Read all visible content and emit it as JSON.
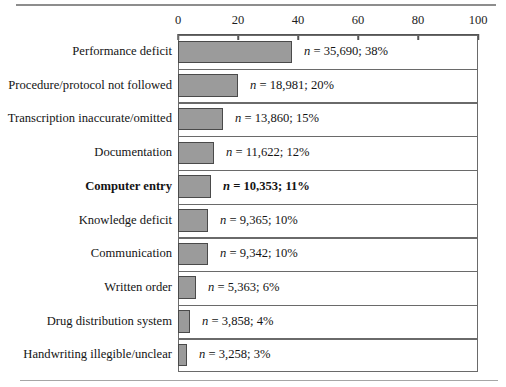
{
  "chart_data": {
    "type": "bar",
    "orientation": "horizontal",
    "title": "",
    "xlabel": "",
    "ylabel": "",
    "xlim": [
      0,
      100
    ],
    "xticks": [
      0,
      20,
      40,
      60,
      80,
      100
    ],
    "xtick_labels": [
      "0",
      "20",
      "40",
      "60",
      "80",
      "100"
    ],
    "grid": false,
    "legend": false,
    "categories": [
      "Performance deficit",
      "Procedure/protocol not followed",
      "Transcription inaccurate/omitted",
      "Documentation",
      "Computer entry",
      "Knowledge deficit",
      "Communication",
      "Written order",
      "Drug distribution system",
      "Handwriting illegible/unclear"
    ],
    "values": [
      38,
      20,
      15,
      12,
      11,
      10,
      10,
      6,
      4,
      3
    ],
    "counts": [
      35690,
      18981,
      13860,
      11622,
      10353,
      9365,
      9342,
      5363,
      3858,
      3258
    ],
    "value_labels": [
      "n = 35,690;  38%",
      "n = 18,981;  20%",
      "n = 13,860;  15%",
      "n = 11,622;  12%",
      "n = 10,353;  11%",
      "n = 9,365;  10%",
      "n = 9,342;  10%",
      "n = 5,363;  6%",
      "n = 3,858;  4%",
      "n = 3,258;  3%"
    ],
    "highlighted_category": "Computer entry",
    "bar_color": "#9b9b9b",
    "bar_edge_color": "#4a4a4a",
    "frame_color": "#6a6a6a"
  },
  "rows": [
    {
      "label": "Performance deficit",
      "value": 38,
      "n_prefix": "n",
      "value_text": " = 35,690;  38%",
      "bold": false
    },
    {
      "label": "Procedure/protocol not followed",
      "value": 20,
      "n_prefix": "n",
      "value_text": " = 18,981;  20%",
      "bold": false
    },
    {
      "label": "Transcription inaccurate/omitted",
      "value": 15,
      "n_prefix": "n",
      "value_text": " = 13,860;  15%",
      "bold": false
    },
    {
      "label": "Documentation",
      "value": 12,
      "n_prefix": "n",
      "value_text": " = 11,622;  12%",
      "bold": false
    },
    {
      "label": "Computer entry",
      "value": 11,
      "n_prefix": "n",
      "value_text": " = 10,353;  11%",
      "bold": true
    },
    {
      "label": "Knowledge deficit",
      "value": 10,
      "n_prefix": "n",
      "value_text": " = 9,365;  10%",
      "bold": false
    },
    {
      "label": "Communication",
      "value": 10,
      "n_prefix": "n",
      "value_text": " = 9,342;  10%",
      "bold": false
    },
    {
      "label": "Written order",
      "value": 6,
      "n_prefix": "n",
      "value_text": " = 5,363;  6%",
      "bold": false
    },
    {
      "label": "Drug distribution system",
      "value": 4,
      "n_prefix": "n",
      "value_text": " = 3,858;  4%",
      "bold": false
    },
    {
      "label": "Handwriting illegible/unclear",
      "value": 3,
      "n_prefix": "n",
      "value_text": " = 3,258;  3%",
      "bold": false
    }
  ],
  "axis": {
    "ticks": [
      {
        "value": 0,
        "label": "0"
      },
      {
        "value": 20,
        "label": "20"
      },
      {
        "value": 40,
        "label": "40"
      },
      {
        "value": 60,
        "label": "60"
      },
      {
        "value": 80,
        "label": "80"
      },
      {
        "value": 100,
        "label": "100"
      }
    ]
  }
}
